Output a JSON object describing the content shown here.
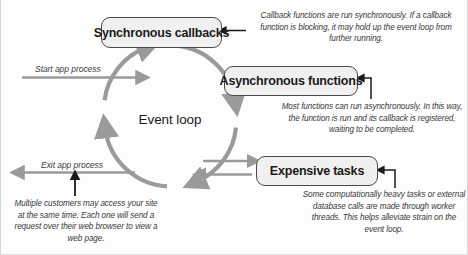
{
  "diagram": {
    "title_label": "Event loop",
    "nodes": [
      {
        "id": "sync",
        "label": "Synchronous callbacks"
      },
      {
        "id": "async",
        "label": "Asynchronous functions"
      },
      {
        "id": "exp",
        "label": "Expensive tasks"
      }
    ],
    "edge_labels": {
      "start": "Start app process",
      "exit": "Exit  app process"
    },
    "annotations": {
      "sync": "Callback functions are run synchronously. If a callback function is blocking, it may hold up the event loop from further running.",
      "async": "Most functions can run asynchronously. In this way, the function is run and its callback is registered, waiting to be completed.",
      "expensive": "Some computationally heavy tasks or external database calls are made through worker threads. This helps alleviate strain on the event loop.",
      "exit": "Multiple customers may access your site at the same time. Each one will send a request over their web browser to view a web page."
    },
    "colors": {
      "loop_arrow": "#9a9a9a",
      "node_fill": "#f0f0f0",
      "node_border": "#4a4a4a",
      "text": "#1b1b1b",
      "annotation_text": "#3a3a3a",
      "leader_line": "#1a1a1a"
    }
  }
}
